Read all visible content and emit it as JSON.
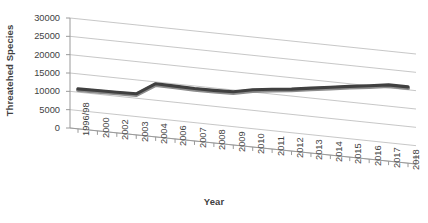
{
  "chart_data": {
    "type": "line",
    "title": "",
    "xlabel": "Year",
    "ylabel": "Threatehed Species",
    "categories": [
      "1996/98",
      "2000",
      "2002",
      "2003",
      "2004",
      "2006",
      "2007",
      "2008",
      "2009",
      "2010",
      "2011",
      "2012",
      "2013",
      "2014",
      "2015",
      "2016",
      "2017",
      "2018"
    ],
    "values": [
      10900,
      11000,
      11100,
      11200,
      14500,
      14400,
      14300,
      14350,
      14500,
      15600,
      16300,
      16900,
      17700,
      18500,
      19300,
      20000,
      20800,
      20800
    ],
    "series": [
      {
        "name": "Threatened Species",
        "values": [
          10900,
          11000,
          11100,
          11200,
          14500,
          14400,
          14300,
          14350,
          14500,
          15600,
          16300,
          16900,
          17700,
          18500,
          19300,
          20000,
          20800,
          20800
        ]
      }
    ],
    "ylim": [
      0,
      30000
    ],
    "yticks": [
      0,
      5000,
      10000,
      15000,
      20000,
      25000,
      30000
    ],
    "ytick_labels": [
      "0",
      "5000",
      "10000",
      "15000",
      "20000",
      "25000",
      "30000"
    ],
    "grid": true,
    "legend": "none",
    "style": "3d-perspective",
    "line_color": "#404040"
  }
}
